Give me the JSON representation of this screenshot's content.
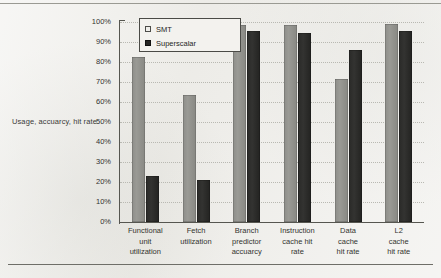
{
  "figure": {
    "y_axis_caption": "Usage, accuarcy, hit rate",
    "legend_title": "",
    "colors": {
      "smt_bar": "#92928d",
      "superscalar_bar": "#2a2a28",
      "background": "#edece8",
      "axis": "#565650",
      "gridline": "#b9b9b2"
    }
  },
  "legend": {
    "items": [
      {
        "label": "SMT",
        "swatch": "light-square-icon"
      },
      {
        "label": "Superscalar",
        "swatch": "dark-square-icon"
      }
    ]
  },
  "chart_data": {
    "type": "bar",
    "title": "",
    "subtitle": "",
    "xlabel": "",
    "ylabel": "Usage, accuarcy, hit rate",
    "ylim": [
      0,
      100
    ],
    "ytick_labels": [
      "100%",
      "90%",
      "80%",
      "70%",
      "60%",
      "50%",
      "40%",
      "30%",
      "20%",
      "10%",
      "0%"
    ],
    "ytick_values": [
      100,
      90,
      80,
      70,
      60,
      50,
      40,
      30,
      20,
      10,
      0
    ],
    "grid": "horizontal-dotted",
    "legend_position": "top-left-inside",
    "categories": [
      "Functional unit utilization",
      "Fetch utilization",
      "Branch predictor accuarcy",
      "Instruction cache hit rate",
      "Data cache hit rate",
      "L2 cache hit rate"
    ],
    "category_lines": [
      [
        "Functional",
        "unit",
        "utilization"
      ],
      [
        "Fetch",
        "utilization"
      ],
      [
        "Branch",
        "predictor",
        "accuarcy"
      ],
      [
        "Instruction",
        "cache hit",
        "rate"
      ],
      [
        "Data",
        "cache",
        "hit rate"
      ],
      [
        "L2",
        "cache",
        "hit rate"
      ]
    ],
    "series": [
      {
        "name": "SMT",
        "values": [
          82.5,
          63.5,
          98.5,
          98.5,
          71.5,
          99.0
        ]
      },
      {
        "name": "Superscalar",
        "values": [
          23.0,
          21.0,
          95.5,
          94.5,
          86.0,
          95.5
        ]
      }
    ],
    "units": "percent"
  }
}
